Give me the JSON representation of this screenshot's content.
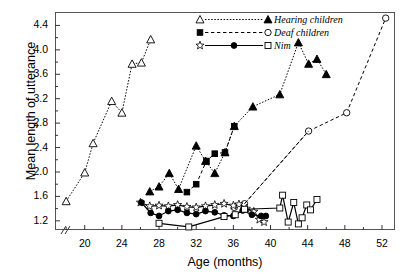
{
  "axes": {
    "ylabel": "Mean length of utterance",
    "xlabel": "Age (months)",
    "yticks": [
      "1.2",
      "1.6",
      "2.0",
      "2.4",
      "2.8",
      "3.2",
      "3.6",
      "4.0",
      "4.4"
    ],
    "xticks": [
      "20",
      "24",
      "28",
      "32",
      "36",
      "40",
      "44",
      "48",
      "52"
    ],
    "ylim": [
      1.05,
      4.62
    ],
    "xlim": [
      16.8,
      53.4
    ],
    "axis_break": "//"
  },
  "legend": {
    "items": [
      {
        "label": "Hearing children",
        "markers": [
          "open-triangle",
          "filled-triangle"
        ],
        "line": "dotted"
      },
      {
        "label": "Deaf children",
        "markers": [
          "filled-square",
          "open-circle"
        ],
        "line": "dashed"
      },
      {
        "label": "Nim",
        "markers": [
          "open-star",
          "filled-circle",
          "open-square"
        ],
        "line": "solid"
      }
    ]
  },
  "colors": {
    "ink": "#000000",
    "frame": "#555555",
    "background": "#ffffff"
  },
  "chart_data": {
    "type": "line",
    "title": "",
    "xlabel": "Age (months)",
    "ylabel": "Mean length of utterance",
    "xlim": [
      16.8,
      53.4
    ],
    "ylim": [
      1.05,
      4.62
    ],
    "grid": false,
    "legend_position": "top-center",
    "series": [
      {
        "name": "Hearing children (open triangle)",
        "marker": "open-triangle",
        "line": "dotted",
        "group": "Hearing children",
        "points": [
          [
            18.0,
            1.52
          ],
          [
            20.0,
            1.99
          ],
          [
            20.9,
            2.47
          ],
          [
            22.9,
            3.16
          ],
          [
            24.0,
            2.97
          ],
          [
            25.1,
            3.77
          ],
          [
            26.1,
            3.79
          ],
          [
            27.1,
            4.17
          ]
        ]
      },
      {
        "name": "Hearing children (filled triangle)",
        "marker": "filled-triangle",
        "line": "dotted",
        "group": "Hearing children",
        "points": [
          [
            27.0,
            1.68
          ],
          [
            28.0,
            1.76
          ],
          [
            29.1,
            1.98
          ],
          [
            30.1,
            1.72
          ],
          [
            32.0,
            2.43
          ],
          [
            33.0,
            2.18
          ],
          [
            34.0,
            1.98
          ],
          [
            35.1,
            2.32
          ],
          [
            36.1,
            2.75
          ],
          [
            38.1,
            3.07
          ],
          [
            41.0,
            3.27
          ],
          [
            43.0,
            4.12
          ],
          [
            44.1,
            3.77
          ],
          [
            45.0,
            3.85
          ],
          [
            46.0,
            3.6
          ]
        ]
      },
      {
        "name": "Deaf children (filled square)",
        "marker": "filled-square",
        "line": "dashed",
        "group": "Deaf children",
        "points": [
          [
            31.0,
            1.67
          ],
          [
            32.0,
            1.8
          ],
          [
            33.1,
            2.18
          ],
          [
            34.0,
            2.3
          ],
          [
            35.1,
            2.32
          ],
          [
            36.1,
            2.75
          ]
        ]
      },
      {
        "name": "Deaf children (open circle)",
        "marker": "open-circle",
        "line": "dashed",
        "group": "Deaf children",
        "points": [
          [
            36.1,
            1.42
          ],
          [
            37.2,
            1.48
          ],
          [
            44.1,
            2.67
          ],
          [
            48.2,
            2.97
          ],
          [
            52.4,
            4.52
          ]
        ]
      },
      {
        "name": "Nim (open star)",
        "marker": "open-star",
        "line": "solid",
        "group": "Nim",
        "points": [
          [
            26.0,
            1.5
          ],
          [
            27.0,
            1.44
          ],
          [
            28.0,
            1.45
          ],
          [
            29.0,
            1.44
          ],
          [
            30.0,
            1.46
          ],
          [
            31.0,
            1.43
          ],
          [
            32.0,
            1.42
          ],
          [
            33.0,
            1.44
          ],
          [
            34.0,
            1.46
          ],
          [
            35.0,
            1.48
          ],
          [
            36.0,
            1.45
          ],
          [
            36.6,
            1.47
          ],
          [
            37.4,
            1.4
          ],
          [
            38.2,
            1.35
          ],
          [
            38.8,
            1.22
          ],
          [
            39.3,
            1.18
          ]
        ]
      },
      {
        "name": "Nim (filled circle)",
        "marker": "filled-circle",
        "line": "solid",
        "group": "Nim",
        "points": [
          [
            26.1,
            1.5
          ],
          [
            27.1,
            1.33
          ],
          [
            28.0,
            1.28
          ],
          [
            29.0,
            1.36
          ],
          [
            30.0,
            1.38
          ],
          [
            31.0,
            1.33
          ],
          [
            32.0,
            1.31
          ],
          [
            33.0,
            1.36
          ],
          [
            34.0,
            1.34
          ],
          [
            35.0,
            1.29
          ],
          [
            36.0,
            1.28
          ],
          [
            37.0,
            1.37
          ],
          [
            38.0,
            1.3
          ],
          [
            39.0,
            1.28
          ],
          [
            39.5,
            1.28
          ]
        ]
      },
      {
        "name": "Nim (open square)",
        "marker": "open-square",
        "line": "solid",
        "group": "Nim",
        "points": [
          [
            28.0,
            1.16
          ],
          [
            31.2,
            1.1
          ],
          [
            35.0,
            1.27
          ],
          [
            36.2,
            1.3
          ],
          [
            37.2,
            1.39
          ],
          [
            41.0,
            1.41
          ],
          [
            41.3,
            1.62
          ],
          [
            41.9,
            1.18
          ],
          [
            42.5,
            1.5
          ],
          [
            43.0,
            1.15
          ],
          [
            43.4,
            1.25
          ],
          [
            43.9,
            1.46
          ],
          [
            44.3,
            1.38
          ],
          [
            45.0,
            1.55
          ]
        ]
      }
    ]
  }
}
